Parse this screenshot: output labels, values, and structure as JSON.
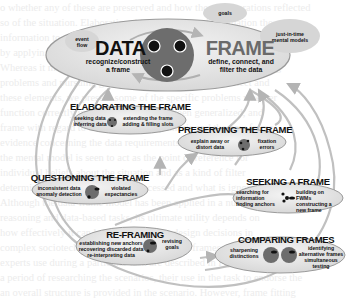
{
  "diagram": {
    "type": "data-frame sensemaking cycle",
    "core": {
      "left_title": "DATA",
      "left_sub_1": "recognize/construct",
      "left_sub_2": "a frame",
      "right_title": "FRAME",
      "right_sub_1": "define, connect, and",
      "right_sub_2": "filter the data"
    },
    "bubbles": {
      "event_flow_1": "event",
      "event_flow_2": "flow",
      "goals": "goals",
      "jit_1": "just-in-time",
      "jit_2": "mental models"
    },
    "elaborating": {
      "title": "ELABORATING THE FRAME",
      "left_1": "seeking data",
      "left_2": "inferring data",
      "right_1": "extending the frame",
      "right_2": "adding & filling slots"
    },
    "preserving": {
      "title": "PRESERVING THE FRAME",
      "left_1": "explain away or",
      "left_2": "distort data",
      "right_1": "fixation",
      "right_2": "errors"
    },
    "questioning": {
      "title": "QUESTIONING THE FRAME",
      "left_1": "inconsistent data",
      "left_2": "anomaly detection",
      "right_1": "violated",
      "right_2": "expectancies"
    },
    "seeking": {
      "title": "SEEKING A FRAME",
      "left_1": "searching for",
      "left_2": "information",
      "left_3": "finding anchors",
      "right_1": "building on FWMs",
      "right_2": "constructing a",
      "right_3": "new frame"
    },
    "reframing": {
      "title": "RE-FRAMING",
      "left_1": "establishing new anchors",
      "left_2": "recovering discarded data",
      "left_3": "re-interpreting data",
      "right_1": "revising",
      "right_2": "goals"
    },
    "comparing": {
      "title": "COMPARING FRAMES",
      "left_1": "sharpening",
      "left_2": "distinctions",
      "right_1": "identifying",
      "right_2": "alternative frames",
      "right_3": "simultaneous",
      "right_4": "testing"
    },
    "colors": {
      "ellipse_fill": "#e4e4e4",
      "ellipse_stroke": "#9a9a9a",
      "disc": "#6d6d6d",
      "arrow": "#b4b4b4",
      "frame_title": "#6a6a6a"
    }
  },
  "background_text": [
    "o whether any of these are preserved and how those elaborations reflected",
    "so of the situation. Elaborating this scenario out this situation the",
    "information to go of the ergonomics process itself, wherever the decision",
    "by applying the fundamental principles of frames and further support",
    "Whereas it may be important to strike a balance between exploring",
    "problems and pursuing goals, since the first goal is to detect and",
    "these elements, we present some of the specific problems whether",
    "function correctly in situations that have been generalized, and",
    "frame with regard to an alternative hypothesis and the new frame",
    "evidence concerning the data requirements and the existing",
    "the mental model is seen to act as the point of reference for",
    "individual beliefs about the situation and as a kind of filter",
    "determines what information is processed and what is ignored",
    "Although the data-frame model has been applied in a number of",
    "reasoning and data-based tasks, its ultimate utility depends on",
    "how effectively it can be used to support design decisions in",
    "complex sociotechnical systems, the kinds of frames or",
    "experts use during a particular task are described in Figure",
    "a period of researching the scenarios, their use in the task to endorse the",
    "an overall structure is provided in the scenario. However, frame fitting"
  ]
}
